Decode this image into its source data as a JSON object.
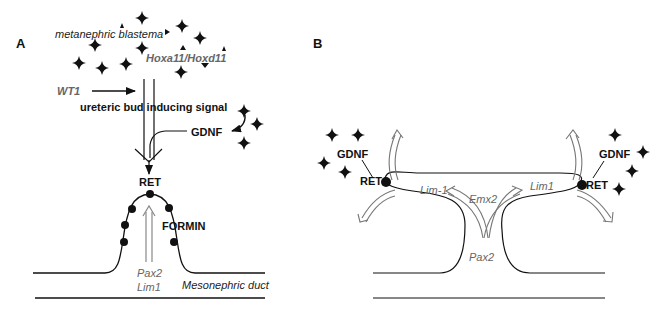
{
  "panels": {
    "A": {
      "label": "A",
      "labels": {
        "metanephric_blastema": "metanephric blastema",
        "hox": "Hoxa11/Hoxd11",
        "wt1": "WT1",
        "signal": "ureteric bud inducing signal",
        "gdnf": "GDNF",
        "ret": "RET",
        "formin": "FORMIN",
        "pax2": "Pax2",
        "lim1": "Lim1",
        "duct": "Mesonephric duct"
      }
    },
    "B": {
      "label": "B",
      "labels": {
        "gdnf_left": "GDNF",
        "ret_left": "RET",
        "gdnf_right": "GDNF",
        "ret_right": "RET",
        "lim1_left": "Lim-1",
        "lim1_right": "Lim1",
        "emx2": "Emx2",
        "pax2": "Pax2"
      }
    }
  },
  "colors": {
    "ink": "#111111",
    "gray_text": "#666666",
    "gray_arrow": "#777777"
  }
}
